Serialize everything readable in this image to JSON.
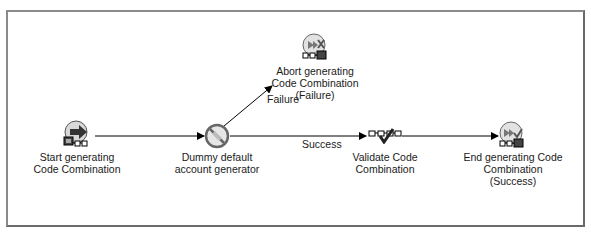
{
  "diagram": {
    "type": "workflow",
    "nodes": [
      {
        "id": "start",
        "label_line1": "Start generating",
        "label_line2": "Code Combination",
        "label_line3": "",
        "icon": "start-process-icon"
      },
      {
        "id": "dummy",
        "label_line1": "Dummy default",
        "label_line2": "account generator",
        "label_line3": "",
        "icon": "no-op-function-icon"
      },
      {
        "id": "abort",
        "label_line1": "Abort generating",
        "label_line2": "Code Combination",
        "label_line3": "(Failure)",
        "icon": "abort-process-icon"
      },
      {
        "id": "validate",
        "label_line1": "Validate Code",
        "label_line2": "Combination",
        "label_line3": "",
        "icon": "validate-function-icon"
      },
      {
        "id": "end",
        "label_line1": "End generating Code",
        "label_line2": "Combination",
        "label_line3": "(Success)",
        "icon": "end-process-icon"
      }
    ],
    "edges": [
      {
        "from": "start",
        "to": "dummy",
        "label": ""
      },
      {
        "from": "dummy",
        "to": "abort",
        "label": "Failure"
      },
      {
        "from": "dummy",
        "to": "validate",
        "label": "Success"
      },
      {
        "from": "validate",
        "to": "end",
        "label": ""
      }
    ]
  }
}
